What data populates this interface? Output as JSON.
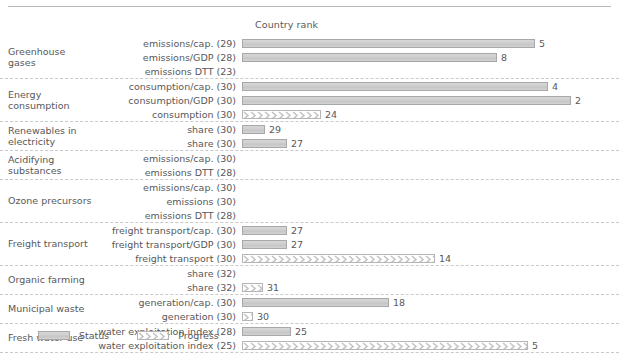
{
  "header": {
    "column_title": "Country rank"
  },
  "legend": {
    "items": [
      {
        "label": "Status",
        "type": "status",
        "color": "#cfcfcf"
      },
      {
        "label": "Progress",
        "type": "progress",
        "color": "#c9c9cb"
      }
    ]
  },
  "scale": {
    "bar_origin_px": 255,
    "bar_max_px": 340,
    "note": "bar length proportional to (total + 1 - rank) / total"
  },
  "chart_data": {
    "type": "bar",
    "orientation": "horizontal",
    "title": "Country rank",
    "xlabel": "",
    "ylabel": "",
    "grid": false,
    "legend_position": "bottom-left",
    "series": [
      {
        "name": "Status",
        "color": "#cfcfcf"
      },
      {
        "name": "Progress",
        "color": "#c9c9cb"
      }
    ],
    "groups": [
      {
        "label": "Greenhouse gases",
        "rows": [
          {
            "label": "emissions/cap. (29)",
            "total": 29,
            "rank": 5,
            "value": 5,
            "type": "status",
            "has_bar": true
          },
          {
            "label": "emissions/GDP (28)",
            "total": 28,
            "rank": 8,
            "value": 8,
            "type": "status",
            "has_bar": true
          },
          {
            "label": "emissions DTT (23)",
            "total": 23,
            "rank": null,
            "value": null,
            "type": "progress",
            "has_bar": false
          }
        ]
      },
      {
        "label": "Energy consumption",
        "rows": [
          {
            "label": "consumption/cap. (30)",
            "total": 30,
            "rank": 4,
            "value": 4,
            "type": "status",
            "has_bar": true
          },
          {
            "label": "consumption/GDP (30)",
            "total": 30,
            "rank": 2,
            "value": 2,
            "type": "status",
            "has_bar": true
          },
          {
            "label": "consumption (30)",
            "total": 30,
            "rank": 24,
            "value": 24,
            "type": "progress",
            "has_bar": true
          }
        ]
      },
      {
        "label": "Renewables in electricity",
        "rows": [
          {
            "label": "share (30)",
            "total": 30,
            "rank": 29,
            "value": 29,
            "type": "status",
            "has_bar": true
          },
          {
            "label": "share (30)",
            "total": 30,
            "rank": 27,
            "value": 27,
            "type": "status",
            "has_bar": true
          }
        ]
      },
      {
        "label": "Acidifying substances",
        "rows": [
          {
            "label": "emissions/cap. (30)",
            "total": 30,
            "rank": null,
            "value": null,
            "type": "status",
            "has_bar": false
          },
          {
            "label": "emissions DTT (28)",
            "total": 28,
            "rank": null,
            "value": null,
            "type": "progress",
            "has_bar": false
          }
        ]
      },
      {
        "label": "Ozone precursors",
        "rows": [
          {
            "label": "emissions/cap. (30)",
            "total": 30,
            "rank": null,
            "value": null,
            "type": "status",
            "has_bar": false
          },
          {
            "label": "emissions (30)",
            "total": 30,
            "rank": null,
            "value": null,
            "type": "status",
            "has_bar": false
          },
          {
            "label": "emissions DTT (28)",
            "total": 28,
            "rank": null,
            "value": null,
            "type": "progress",
            "has_bar": false
          }
        ]
      },
      {
        "label": "Freight transport",
        "rows": [
          {
            "label": "freight transport/cap. (30)",
            "total": 30,
            "rank": 27,
            "value": 27,
            "type": "status",
            "has_bar": true
          },
          {
            "label": "freight transport/GDP (30)",
            "total": 30,
            "rank": 27,
            "value": 27,
            "type": "status",
            "has_bar": true
          },
          {
            "label": "freight transport (30)",
            "total": 30,
            "rank": 14,
            "value": 14,
            "type": "progress",
            "has_bar": true
          }
        ]
      },
      {
        "label": "Organic farming",
        "rows": [
          {
            "label": "share (32)",
            "total": 32,
            "rank": null,
            "value": null,
            "type": "status",
            "has_bar": false
          },
          {
            "label": "share (32)",
            "total": 32,
            "rank": 31,
            "value": 31,
            "type": "progress",
            "has_bar": true
          }
        ]
      },
      {
        "label": "Municipal waste",
        "rows": [
          {
            "label": "generation/cap. (30)",
            "total": 30,
            "rank": 18,
            "value": 18,
            "type": "status",
            "has_bar": true
          },
          {
            "label": "generation (30)",
            "total": 30,
            "rank": 30,
            "value": 30,
            "type": "progress",
            "has_bar": true
          }
        ]
      },
      {
        "label": "Fresh water use",
        "rows": [
          {
            "label": "water exploitation index (28)",
            "total": 28,
            "rank": 25,
            "value": 25,
            "type": "status",
            "has_bar": true
          },
          {
            "label": "water exploitation index (25)",
            "total": 25,
            "rank": 5,
            "value": 5,
            "type": "progress",
            "has_bar": true
          }
        ]
      }
    ]
  }
}
